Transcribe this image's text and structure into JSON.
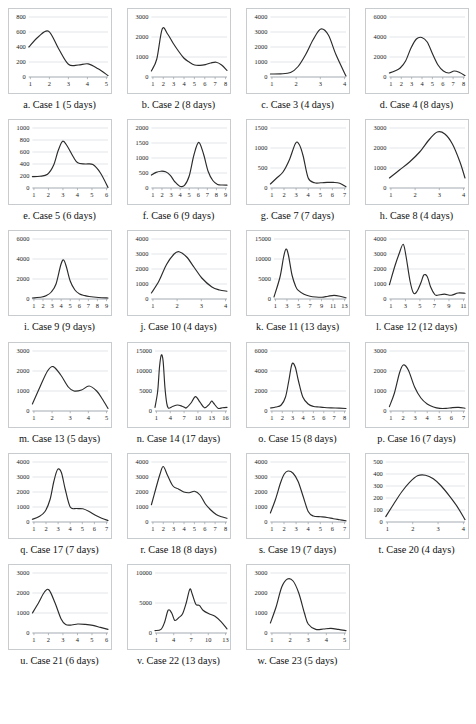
{
  "figure": {
    "columns": 4,
    "panel_count": 23,
    "axis_color": "#9aa0a6",
    "grid_color": "#cfd4d8",
    "line_color": "#2b2b2b",
    "background": "#ffffff"
  },
  "chart_data": [
    {
      "id": "case-1",
      "type": "line",
      "caption": "a. Case 1 (5 days)",
      "title": "",
      "xlabel": "",
      "ylabel": "",
      "xticks": [
        "1",
        "2",
        "3",
        "4",
        "5"
      ],
      "yticks": [
        "0",
        "200",
        "400",
        "600",
        "800"
      ],
      "ylim": [
        0,
        800
      ],
      "xlim": [
        1,
        5
      ],
      "grid": true,
      "x": [
        1,
        1.5,
        2,
        2.5,
        3,
        3.5,
        4,
        4.5,
        5
      ],
      "values": [
        400,
        540,
        610,
        380,
        170,
        160,
        175,
        110,
        20
      ]
    },
    {
      "id": "case-2",
      "type": "line",
      "caption": "b. Case 2 (8 days)",
      "xticks": [
        "1",
        "2",
        "3",
        "4",
        "5",
        "6",
        "7",
        "8"
      ],
      "yticks": [
        "0",
        "1000",
        "2000",
        "3000"
      ],
      "ylim": [
        0,
        3000
      ],
      "xlim": [
        1,
        8
      ],
      "grid": true,
      "x": [
        1,
        1.5,
        2,
        2.5,
        3,
        3.5,
        4,
        4.5,
        5,
        5.5,
        6,
        6.5,
        7,
        7.5,
        8
      ],
      "values": [
        300,
        900,
        2400,
        2150,
        1700,
        1300,
        950,
        750,
        600,
        580,
        620,
        700,
        740,
        600,
        330
      ]
    },
    {
      "id": "case-3",
      "type": "line",
      "caption": "c. Case 3 (4 days)",
      "xticks": [
        "1",
        "2",
        "3",
        "4"
      ],
      "yticks": [
        "0",
        "1000",
        "2000",
        "3000",
        "4000"
      ],
      "ylim": [
        0,
        4000
      ],
      "xlim": [
        1,
        4
      ],
      "grid": true,
      "x": [
        1,
        1.4,
        1.8,
        2.1,
        2.4,
        2.7,
        3.0,
        3.3,
        3.6,
        4.0
      ],
      "values": [
        200,
        210,
        300,
        700,
        1500,
        2500,
        3200,
        2800,
        1500,
        60
      ]
    },
    {
      "id": "case-4",
      "type": "line",
      "caption": "d. Case 4 (8 days)",
      "xticks": [
        "1",
        "2",
        "3",
        "4",
        "5",
        "6",
        "7",
        "8"
      ],
      "yticks": [
        "0",
        "2000",
        "4000",
        "6000"
      ],
      "ylim": [
        0,
        6000
      ],
      "xlim": [
        1,
        8
      ],
      "grid": true,
      "x": [
        1,
        1.5,
        2,
        2.5,
        3,
        3.5,
        4,
        4.5,
        5,
        5.5,
        6,
        6.5,
        7,
        7.5,
        8
      ],
      "values": [
        400,
        600,
        900,
        1600,
        2900,
        3800,
        3950,
        3500,
        2300,
        1200,
        600,
        400,
        600,
        450,
        150
      ]
    },
    {
      "id": "case-5",
      "type": "line",
      "caption": "e. Case 5 (6 days)",
      "xticks": [
        "1",
        "2",
        "3",
        "4",
        "5",
        "6"
      ],
      "yticks": [
        "0",
        "200",
        "400",
        "600",
        "800",
        "1000"
      ],
      "ylim": [
        0,
        1000
      ],
      "xlim": [
        1,
        6
      ],
      "grid": true,
      "x": [
        1,
        1.5,
        2,
        2.4,
        2.7,
        3,
        3.3,
        3.7,
        4,
        4.5,
        5,
        5.5,
        6
      ],
      "values": [
        190,
        195,
        230,
        380,
        620,
        780,
        700,
        520,
        420,
        400,
        390,
        250,
        10
      ]
    },
    {
      "id": "case-6",
      "type": "line",
      "caption": "f. Case 6 (9 days)",
      "xticks": [
        "1",
        "2",
        "3",
        "4",
        "5",
        "6",
        "7",
        "8",
        "9"
      ],
      "yticks": [
        "0",
        "500",
        "1000",
        "1500",
        "2000"
      ],
      "ylim": [
        0,
        2000
      ],
      "xlim": [
        1,
        9
      ],
      "grid": true,
      "x": [
        1,
        1.5,
        2,
        2.5,
        3,
        3.5,
        4,
        4.5,
        5,
        5.5,
        6,
        6.5,
        7,
        7.5,
        8,
        8.5,
        9
      ],
      "values": [
        430,
        520,
        560,
        540,
        420,
        200,
        60,
        90,
        400,
        1100,
        1520,
        1150,
        560,
        250,
        120,
        100,
        95
      ]
    },
    {
      "id": "case-7",
      "type": "line",
      "caption": "g. Case 7 (7 days)",
      "xticks": [
        "1",
        "2",
        "3",
        "4",
        "5",
        "6",
        "7"
      ],
      "yticks": [
        "0",
        "500",
        "1000",
        "1500"
      ],
      "ylim": [
        0,
        1500
      ],
      "xlim": [
        1,
        7
      ],
      "grid": true,
      "x": [
        1,
        1.5,
        2,
        2.5,
        3,
        3.3,
        3.6,
        4,
        4.5,
        5,
        5.5,
        6,
        6.5,
        7
      ],
      "values": [
        100,
        250,
        400,
        700,
        1120,
        1080,
        800,
        250,
        130,
        130,
        140,
        140,
        120,
        30
      ]
    },
    {
      "id": "case-8",
      "type": "line",
      "caption": "h. Case 8 (4 days)",
      "xticks": [
        "1",
        "2",
        "3",
        "4"
      ],
      "yticks": [
        "0",
        "1000",
        "2000",
        "3000"
      ],
      "ylim": [
        0,
        3000
      ],
      "xlim": [
        1,
        4
      ],
      "grid": true,
      "x": [
        1,
        1.4,
        1.8,
        2.2,
        2.6,
        2.9,
        3.2,
        3.5,
        3.8,
        4
      ],
      "values": [
        500,
        900,
        1300,
        1800,
        2450,
        2800,
        2700,
        2200,
        1300,
        500
      ]
    },
    {
      "id": "case-9",
      "type": "line",
      "caption": "i. Case 9 (9 days)",
      "xticks": [
        "1",
        "2",
        "3",
        "4",
        "5",
        "6",
        "7",
        "8",
        "9"
      ],
      "yticks": [
        "0",
        "2000",
        "4000",
        "6000"
      ],
      "ylim": [
        0,
        6000
      ],
      "xlim": [
        1,
        9
      ],
      "grid": true,
      "x": [
        1,
        2,
        2.5,
        3,
        3.5,
        4,
        4.3,
        4.6,
        5,
        5.5,
        6,
        6.5,
        7,
        8,
        9
      ],
      "values": [
        100,
        200,
        350,
        700,
        1500,
        3400,
        3900,
        3200,
        1800,
        900,
        500,
        350,
        250,
        150,
        100
      ]
    },
    {
      "id": "case-10",
      "type": "line",
      "caption": "j. Case 10 (4 days)",
      "xticks": [
        "1",
        "2",
        "3",
        "4"
      ],
      "yticks": [
        "0",
        "1000",
        "2000",
        "3000",
        "4000"
      ],
      "ylim": [
        0,
        4000
      ],
      "xlim": [
        1,
        4
      ],
      "grid": true,
      "x": [
        1,
        1.3,
        1.6,
        1.9,
        2.1,
        2.4,
        2.7,
        3,
        3.4,
        3.7,
        4
      ],
      "values": [
        400,
        1200,
        2300,
        3000,
        3150,
        2800,
        2100,
        1400,
        800,
        600,
        520
      ]
    },
    {
      "id": "case-11",
      "type": "line",
      "caption": "k. Case 11 (13 days)",
      "xticks": [
        "1",
        "3",
        "5",
        "7",
        "9",
        "11",
        "13"
      ],
      "yticks": [
        "0",
        "5000",
        "10000",
        "15000"
      ],
      "ylim": [
        0,
        15000
      ],
      "xlim": [
        1,
        13
      ],
      "grid": true,
      "x": [
        1,
        2,
        2.6,
        3,
        3.4,
        4,
        4.6,
        5,
        6,
        7,
        8,
        9,
        10,
        11,
        12,
        13
      ],
      "values": [
        500,
        5500,
        10500,
        12500,
        11000,
        6000,
        3200,
        2200,
        1200,
        700,
        500,
        450,
        700,
        900,
        700,
        300
      ]
    },
    {
      "id": "case-12",
      "type": "line",
      "caption": "l. Case 12 (12 days)",
      "xticks": [
        "1",
        "3",
        "5",
        "7",
        "9",
        "11"
      ],
      "yticks": [
        "0",
        "1000",
        "2000",
        "3000",
        "4000"
      ],
      "ylim": [
        0,
        4000
      ],
      "xlim": [
        1,
        12
      ],
      "grid": true,
      "x": [
        1,
        1.8,
        2.4,
        3,
        3.4,
        4,
        4.5,
        5,
        5.6,
        6,
        6.5,
        7,
        7.6,
        8,
        9,
        10,
        11,
        12
      ],
      "values": [
        950,
        2200,
        3000,
        3650,
        2900,
        1200,
        400,
        500,
        1100,
        1600,
        1500,
        800,
        300,
        250,
        320,
        250,
        400,
        380
      ]
    },
    {
      "id": "case-13",
      "type": "line",
      "caption": "m. Case 13 (5 days)",
      "xticks": [
        "1",
        "2",
        "3",
        "4",
        "5"
      ],
      "yticks": [
        "0",
        "1000",
        "2000",
        "3000"
      ],
      "ylim": [
        0,
        3000
      ],
      "xlim": [
        1,
        5
      ],
      "grid": true,
      "x": [
        1,
        1.4,
        1.8,
        2.1,
        2.5,
        2.9,
        3.2,
        3.6,
        4,
        4.4,
        4.7,
        5
      ],
      "values": [
        350,
        1200,
        2000,
        2220,
        1800,
        1200,
        1000,
        1050,
        1250,
        1000,
        600,
        130
      ]
    },
    {
      "id": "case-14",
      "type": "line",
      "caption": "n. Case 14 (17 days)",
      "xticks": [
        "1",
        "4",
        "7",
        "10",
        "13",
        "16"
      ],
      "yticks": [
        "0",
        "5000",
        "10000",
        "15000"
      ],
      "ylim": [
        0,
        15000
      ],
      "xlim": [
        1,
        17
      ],
      "grid": true,
      "x": [
        1,
        1.6,
        2,
        2.4,
        2.8,
        3.2,
        3.6,
        4,
        5,
        6,
        7,
        7.6,
        8,
        9,
        10,
        11,
        12,
        13,
        13.6,
        14,
        15,
        16,
        17
      ],
      "values": [
        900,
        5000,
        11000,
        14000,
        12500,
        6000,
        2000,
        700,
        1200,
        1500,
        1200,
        900,
        800,
        2000,
        3600,
        2200,
        800,
        1600,
        2500,
        2000,
        700,
        800,
        900
      ]
    },
    {
      "id": "case-15",
      "type": "line",
      "caption": "o. Case 15 (8 days)",
      "xticks": [
        "1",
        "2",
        "3",
        "4",
        "5",
        "6",
        "7",
        "8"
      ],
      "yticks": [
        "0",
        "2000",
        "4000",
        "6000"
      ],
      "ylim": [
        0,
        6000
      ],
      "xlim": [
        1,
        8
      ],
      "grid": true,
      "x": [
        1,
        1.5,
        2,
        2.4,
        2.7,
        3,
        3.3,
        3.6,
        4,
        4.5,
        5,
        5.5,
        6,
        7,
        8
      ],
      "values": [
        300,
        400,
        600,
        1400,
        3000,
        4700,
        4400,
        3000,
        1400,
        700,
        450,
        400,
        350,
        300,
        250
      ]
    },
    {
      "id": "case-16",
      "type": "line",
      "caption": "p. Case 16 (7 days)",
      "xticks": [
        "1",
        "2",
        "3",
        "4",
        "5",
        "6",
        "7"
      ],
      "yticks": [
        "0",
        "1000",
        "2000",
        "3000"
      ],
      "ylim": [
        0,
        3000
      ],
      "xlim": [
        1,
        7
      ],
      "grid": true,
      "x": [
        1,
        1.4,
        1.8,
        2.1,
        2.5,
        3,
        3.5,
        4,
        4.5,
        5,
        5.5,
        6,
        6.5,
        7
      ],
      "values": [
        220,
        900,
        1900,
        2300,
        2050,
        1200,
        650,
        350,
        200,
        130,
        130,
        170,
        180,
        140
      ]
    },
    {
      "id": "case-17",
      "type": "line",
      "caption": "q. Case 17 (7 days)",
      "xticks": [
        "1",
        "2",
        "3",
        "4",
        "5",
        "6",
        "7"
      ],
      "yticks": [
        "0",
        "1000",
        "2000",
        "3000",
        "4000"
      ],
      "ylim": [
        0,
        4000
      ],
      "xlim": [
        1,
        7
      ],
      "grid": true,
      "x": [
        1,
        1.5,
        2,
        2.4,
        2.7,
        3,
        3.3,
        3.6,
        4,
        4.5,
        5,
        5.5,
        6,
        6.5,
        7
      ],
      "values": [
        180,
        350,
        700,
        1500,
        2700,
        3500,
        3300,
        2200,
        1000,
        900,
        880,
        700,
        450,
        250,
        100
      ]
    },
    {
      "id": "case-18",
      "type": "line",
      "caption": "r. Case 18 (8 days)",
      "xticks": [
        "1",
        "2",
        "3",
        "4",
        "5",
        "6",
        "7",
        "8"
      ],
      "yticks": [
        "0",
        "1000",
        "2000",
        "3000",
        "4000"
      ],
      "ylim": [
        0,
        4000
      ],
      "xlim": [
        1,
        8
      ],
      "grid": true,
      "x": [
        1,
        1.4,
        1.8,
        2.1,
        2.5,
        3,
        3.5,
        4,
        4.5,
        5,
        5.5,
        6,
        6.5,
        7,
        7.5,
        8
      ],
      "values": [
        1150,
        2200,
        3200,
        3700,
        3100,
        2400,
        2200,
        2000,
        1950,
        2050,
        1800,
        1200,
        800,
        500,
        350,
        250
      ]
    },
    {
      "id": "case-19",
      "type": "line",
      "caption": "s. Case 19 (7 days)",
      "xticks": [
        "1",
        "2",
        "3",
        "4",
        "5",
        "6",
        "7"
      ],
      "yticks": [
        "0",
        "1000",
        "2000",
        "3000",
        "4000"
      ],
      "ylim": [
        0,
        4000
      ],
      "xlim": [
        1,
        7
      ],
      "grid": true,
      "x": [
        1,
        1.4,
        1.8,
        2.1,
        2.4,
        2.8,
        3.2,
        3.6,
        4,
        4.4,
        5,
        5.5,
        6,
        6.5,
        7
      ],
      "values": [
        600,
        1500,
        2600,
        3200,
        3400,
        3250,
        2700,
        1700,
        700,
        400,
        350,
        300,
        220,
        150,
        80
      ]
    },
    {
      "id": "case-20",
      "type": "line",
      "caption": "t. Case 20 (4 days)",
      "xticks": [
        "1",
        "2",
        "3",
        "4"
      ],
      "yticks": [
        "0",
        "100",
        "200",
        "300",
        "400",
        "500"
      ],
      "ylim": [
        0,
        500
      ],
      "xlim": [
        1,
        4
      ],
      "grid": true,
      "x": [
        1,
        1.3,
        1.6,
        1.9,
        2.2,
        2.5,
        2.8,
        3.1,
        3.4,
        3.7,
        4
      ],
      "values": [
        45,
        150,
        250,
        330,
        385,
        390,
        360,
        300,
        220,
        130,
        20
      ]
    },
    {
      "id": "case-21",
      "type": "line",
      "caption": "u. Case 21 (6 days)",
      "xticks": [
        "1",
        "2",
        "3",
        "4",
        "5",
        "6"
      ],
      "yticks": [
        "0",
        "1000",
        "2000",
        "3000"
      ],
      "ylim": [
        0,
        3000
      ],
      "xlim": [
        1,
        6
      ],
      "grid": true,
      "x": [
        1,
        1.4,
        1.8,
        2.1,
        2.5,
        2.9,
        3.2,
        3.6,
        4,
        4.5,
        5,
        5.5,
        6
      ],
      "values": [
        1000,
        1500,
        2050,
        2150,
        1500,
        700,
        420,
        400,
        450,
        430,
        380,
        280,
        180
      ]
    },
    {
      "id": "case-22",
      "type": "line",
      "caption": "v. Case 22 (13 days)",
      "xticks": [
        "1",
        "4",
        "7",
        "10",
        "13"
      ],
      "yticks": [
        "0",
        "5000",
        "10000"
      ],
      "ylim": [
        0,
        10000
      ],
      "xlim": [
        1,
        13
      ],
      "grid": true,
      "x": [
        1,
        2,
        2.6,
        3.2,
        3.8,
        4.3,
        5,
        5.6,
        6.2,
        6.8,
        7.2,
        7.8,
        8.4,
        9,
        10,
        11,
        12,
        13
      ],
      "values": [
        400,
        600,
        1800,
        3800,
        3300,
        2100,
        2600,
        3200,
        5000,
        7300,
        6500,
        4800,
        4600,
        3800,
        3200,
        2800,
        1900,
        700
      ]
    },
    {
      "id": "case-23",
      "type": "line",
      "caption": "w. Case 23 (5 days)",
      "xticks": [
        "1",
        "2",
        "3",
        "4",
        "5"
      ],
      "yticks": [
        "0",
        "1000",
        "2000",
        "3000"
      ],
      "ylim": [
        0,
        3000
      ],
      "xlim": [
        1,
        5
      ],
      "grid": true,
      "x": [
        1,
        1.3,
        1.6,
        1.9,
        2.2,
        2.5,
        2.8,
        3,
        3.4,
        3.8,
        4.2,
        4.6,
        5
      ],
      "values": [
        500,
        1300,
        2300,
        2700,
        2600,
        2000,
        1000,
        450,
        180,
        200,
        230,
        180,
        120
      ]
    }
  ]
}
